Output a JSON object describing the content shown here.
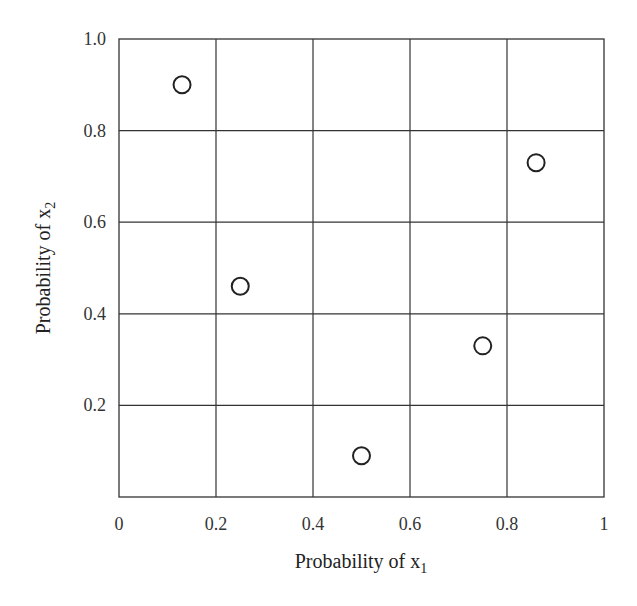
{
  "chart_data": {
    "type": "scatter",
    "title": "",
    "xlabel": "Probability of x1",
    "ylabel": "Probability of x2",
    "xlabel_parts": {
      "main": "Probability of x",
      "sub": "1"
    },
    "ylabel_parts": {
      "main": "Probability of x",
      "sub": "2"
    },
    "xlim": [
      0,
      1
    ],
    "ylim": [
      0,
      1
    ],
    "x_ticks": [
      0,
      0.2,
      0.4,
      0.6,
      0.8,
      1
    ],
    "x_tick_labels": [
      "0",
      "0.2",
      "0.4",
      "0.6",
      "0.8",
      "1"
    ],
    "y_ticks": [
      0.2,
      0.4,
      0.6,
      0.8,
      1.0
    ],
    "y_tick_labels": [
      "0.2",
      "0.4",
      "0.6",
      "0.8",
      "1.0"
    ],
    "grid": true,
    "legend": null,
    "marker": "open-circle",
    "series": [
      {
        "name": "points",
        "x": [
          0.13,
          0.25,
          0.5,
          0.75,
          0.86
        ],
        "y": [
          0.9,
          0.46,
          0.09,
          0.33,
          0.73
        ]
      }
    ]
  },
  "colors": {
    "grid": "#333333",
    "marker_stroke": "#222222",
    "background": "#ffffff"
  }
}
